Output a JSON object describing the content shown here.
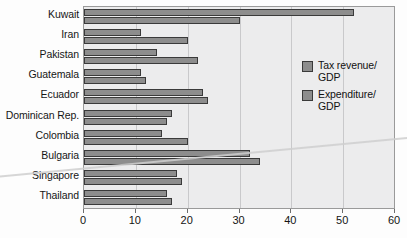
{
  "chart_data": {
    "type": "bar",
    "orientation": "horizontal",
    "title": "",
    "xlabel": "",
    "ylabel": "",
    "xlim": [
      0,
      60
    ],
    "xticks": [
      0,
      10,
      20,
      30,
      40,
      50,
      60
    ],
    "grid": true,
    "legend_position": "upper right inside",
    "categories": [
      "Kuwait",
      "Iran",
      "Pakistan",
      "Guatemala",
      "Ecuador",
      "Dominican Rep.",
      "Colombia",
      "Bulgaria",
      "Singapore",
      "Thailand"
    ],
    "series": [
      {
        "name": "Tax revenue/GDP",
        "color": "#8d8d8d",
        "values": [
          52,
          11,
          14,
          11,
          23,
          17,
          15,
          32,
          18,
          16
        ]
      },
      {
        "name": "Expenditure/GDP",
        "color": "#8d8d8d",
        "values": [
          30,
          20,
          22,
          12,
          24,
          16,
          20,
          34,
          19,
          17
        ]
      }
    ]
  },
  "legend": {
    "items": [
      {
        "label_line1": "Tax revenue/",
        "label_line2": "GDP"
      },
      {
        "label_line1": "Expenditure/",
        "label_line2": "GDP"
      }
    ]
  },
  "colors": {
    "bar_fill": "#8d8d8d",
    "bar_border": "#3a3a3a",
    "plot_background": "#ececed",
    "gridline": "#c9c9cb",
    "axis": "#9a9a9a"
  }
}
